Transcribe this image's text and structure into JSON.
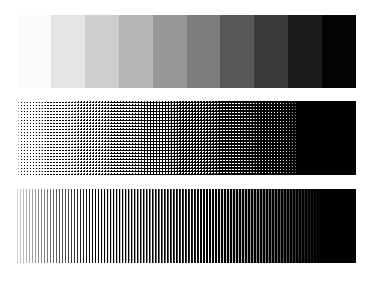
{
  "document": {
    "title": "Grayscale Reproduction Test Target",
    "background_color": "#ffffff",
    "width": 378,
    "height": 281
  },
  "strips": [
    {
      "id": "step-wedge",
      "name": "Grayscale Step Wedge",
      "pattern": "continuous-tone-steps",
      "step_count": 10,
      "x": 17,
      "y": 15,
      "width": 339,
      "height": 73,
      "steps": [
        {
          "index": 1,
          "label": "0%",
          "gray_value": 250,
          "color": "#fafafa"
        },
        {
          "index": 2,
          "label": "10%",
          "gray_value": 228,
          "color": "#e4e4e4"
        },
        {
          "index": 3,
          "label": "20%",
          "gray_value": 206,
          "color": "#cecece"
        },
        {
          "index": 4,
          "label": "30%",
          "gray_value": 182,
          "color": "#b6b6b6"
        },
        {
          "index": 5,
          "label": "40%",
          "gray_value": 150,
          "color": "#969696"
        },
        {
          "index": 6,
          "label": "50%",
          "gray_value": 124,
          "color": "#7c7c7c"
        },
        {
          "index": 7,
          "label": "60%",
          "gray_value": 88,
          "color": "#585858"
        },
        {
          "index": 8,
          "label": "70%",
          "gray_value": 58,
          "color": "#3a3a3a"
        },
        {
          "index": 9,
          "label": "85%",
          "gray_value": 26,
          "color": "#1a1a1a"
        },
        {
          "index": 10,
          "label": "100%",
          "gray_value": 4,
          "color": "#040404"
        }
      ]
    },
    {
      "id": "halftone",
      "name": "Halftone Dot Screen Gradient",
      "pattern": "dot-screen",
      "x": 17,
      "y": 101,
      "width": 339,
      "height": 74,
      "cell_pitch_px": 3,
      "start_density_percent": 4,
      "end_density_percent": 100,
      "solid_from_percent": 88,
      "ink_color": "#000000",
      "paper_color": "#ffffff"
    },
    {
      "id": "linescreen",
      "name": "Vertical Line Screen Gradient",
      "pattern": "vertical-lines",
      "x": 17,
      "y": 189,
      "width": 339,
      "height": 74,
      "line_pitch_px": 3,
      "start_density_percent": 6,
      "end_density_percent": 100,
      "solid_from_percent": 90,
      "ink_color": "#000000",
      "paper_color": "#ffffff"
    }
  ]
}
